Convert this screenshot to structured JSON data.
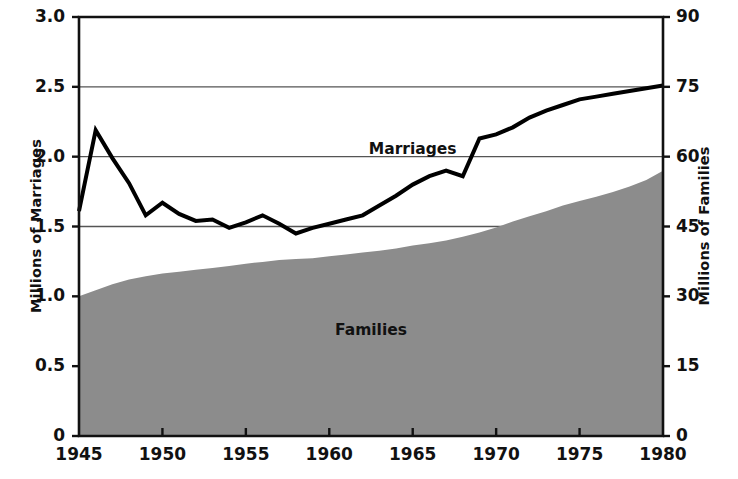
{
  "chart_data": {
    "type": "line",
    "title": "",
    "xlabel": "",
    "ylabel": "Millions of Marriages",
    "ylabel_right": "Millions of Families",
    "xlim": [
      1945,
      1980
    ],
    "ylim": [
      0,
      3.0
    ],
    "ylim_right": [
      0,
      90
    ],
    "grid": true,
    "gridlines_at": [
      1.5,
      2.0,
      2.5
    ],
    "legend_position": "inline-annotation",
    "x_ticks": [
      "1945",
      "1950",
      "1955",
      "1960",
      "1965",
      "1970",
      "1975",
      "1980"
    ],
    "x_tick_values": [
      1945,
      1950,
      1955,
      1960,
      1965,
      1970,
      1975,
      1980
    ],
    "y_ticks_left": [
      "0",
      "0.5",
      "1.0",
      "1.5",
      "2.0",
      "2.5",
      "3.0"
    ],
    "y_tick_values_left": [
      0,
      0.5,
      1.0,
      1.5,
      2.0,
      2.5,
      3.0
    ],
    "y_ticks_right": [
      "0",
      "15",
      "30",
      "45",
      "60",
      "75",
      "90"
    ],
    "y_tick_values_right": [
      0,
      15,
      30,
      45,
      60,
      75,
      90
    ],
    "series": [
      {
        "name": "Marriages",
        "label": "Marriages",
        "type": "line",
        "axis": "left",
        "units": "millions",
        "color": "#000000",
        "line_width": 4,
        "x": [
          1945,
          1946,
          1947,
          1948,
          1949,
          1950,
          1951,
          1952,
          1953,
          1954,
          1955,
          1956,
          1957,
          1958,
          1959,
          1960,
          1961,
          1962,
          1963,
          1964,
          1965,
          1966,
          1967,
          1968,
          1969,
          1970,
          1971,
          1972,
          1973,
          1974,
          1975,
          1976,
          1977,
          1978,
          1979,
          1980
        ],
        "values": [
          1.61,
          2.19,
          1.99,
          1.81,
          1.58,
          1.67,
          1.59,
          1.54,
          1.55,
          1.49,
          1.53,
          1.58,
          1.52,
          1.45,
          1.49,
          1.52,
          1.55,
          1.58,
          1.65,
          1.72,
          1.8,
          1.86,
          1.9,
          1.86,
          2.13,
          2.16,
          2.21,
          2.28,
          2.33,
          2.37,
          2.41,
          2.43,
          2.45,
          2.47,
          2.49,
          2.51
        ]
      },
      {
        "name": "Families",
        "label": "Families",
        "type": "area",
        "axis": "right",
        "units": "millions",
        "color": "#8c8c8c",
        "x": [
          1945,
          1946,
          1947,
          1948,
          1949,
          1950,
          1951,
          1952,
          1953,
          1954,
          1955,
          1956,
          1957,
          1958,
          1959,
          1960,
          1961,
          1962,
          1963,
          1964,
          1965,
          1966,
          1967,
          1968,
          1969,
          1970,
          1971,
          1972,
          1973,
          1974,
          1975,
          1976,
          1977,
          1978,
          1979,
          1980
        ],
        "values": [
          30.0,
          31.3,
          32.6,
          33.6,
          34.3,
          34.9,
          35.3,
          35.7,
          36.1,
          36.5,
          37.0,
          37.4,
          37.8,
          38.0,
          38.2,
          38.6,
          39.0,
          39.4,
          39.8,
          40.3,
          40.9,
          41.4,
          42.0,
          42.8,
          43.7,
          44.8,
          46.1,
          47.2,
          48.3,
          49.5,
          50.5,
          51.4,
          52.4,
          53.6,
          55.0,
          57.0
        ]
      }
    ],
    "annotations": [
      {
        "text": "Marriages",
        "x": 1965.0,
        "y": 2.02,
        "anchor": "middle"
      },
      {
        "text": "Families",
        "x": 1962.5,
        "y": 0.72,
        "anchor": "middle"
      }
    ]
  },
  "plot_geometry": {
    "left": 79,
    "right": 663,
    "top": 17,
    "bottom": 436
  },
  "colors": {
    "axis": "#111111",
    "grid": "#555555",
    "line": "#000000",
    "area_fill": "#8c8c8c",
    "background": "#ffffff"
  }
}
